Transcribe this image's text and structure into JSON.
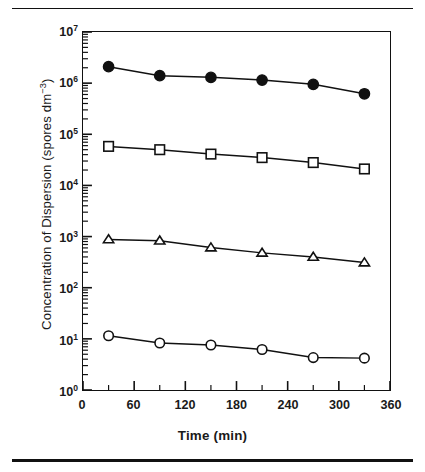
{
  "figure": {
    "background_color": "#ffffff",
    "ink_color": "#111111"
  },
  "chart_data": {
    "type": "line",
    "title": "",
    "xlabel": "Time (min)",
    "ylabel": "Concentration of Dispersion (spores dm−3)",
    "ylabel_parts": {
      "main": "Concentration of Dispersion (spores dm",
      "exponent": "−3",
      "tail": ")"
    },
    "x": [
      30,
      90,
      150,
      210,
      270,
      330
    ],
    "xlim": [
      0,
      360
    ],
    "ylim": [
      1,
      10000000
    ],
    "yscale": "log",
    "grid": false,
    "legend": "none",
    "xticks": [
      0,
      60,
      120,
      180,
      240,
      300,
      360
    ],
    "xtick_labels": [
      "0",
      "60",
      "120",
      "180",
      "240",
      "300",
      "360"
    ],
    "x_minor_tick_interval": 30,
    "yticks": [
      1,
      10,
      100,
      1000,
      10000,
      100000,
      1000000,
      10000000
    ],
    "ytick_labels": [
      "10⁰",
      "10¹",
      "10²",
      "10³",
      "10⁴",
      "10⁵",
      "10⁶",
      "10⁷"
    ],
    "ytick_mantissas": [
      "10",
      "10",
      "10",
      "10",
      "10",
      "10",
      "10",
      "10"
    ],
    "ytick_exponents": [
      "0",
      "1",
      "2",
      "3",
      "4",
      "5",
      "6",
      "7"
    ],
    "series": [
      {
        "name": "filled-circle-series",
        "marker": "filled-circle",
        "marker_fill": "#111111",
        "marker_edge": "#111111",
        "line_color": "#111111",
        "values": [
          2100000,
          1400000,
          1300000,
          1150000,
          950000,
          620000
        ]
      },
      {
        "name": "open-square-series",
        "marker": "open-square",
        "marker_fill": "#ffffff",
        "marker_edge": "#111111",
        "line_color": "#111111",
        "values": [
          58000,
          50000,
          41000,
          35000,
          28000,
          21000
        ]
      },
      {
        "name": "open-triangle-series",
        "marker": "open-triangle",
        "marker_fill": "#ffffff",
        "marker_edge": "#111111",
        "line_color": "#111111",
        "values": [
          880,
          830,
          610,
          480,
          400,
          310
        ]
      },
      {
        "name": "open-circle-series",
        "marker": "open-circle",
        "marker_fill": "#ffffff",
        "marker_edge": "#111111",
        "line_color": "#111111",
        "values": [
          11.5,
          8.3,
          7.6,
          6.2,
          4.3,
          4.2
        ]
      }
    ]
  }
}
